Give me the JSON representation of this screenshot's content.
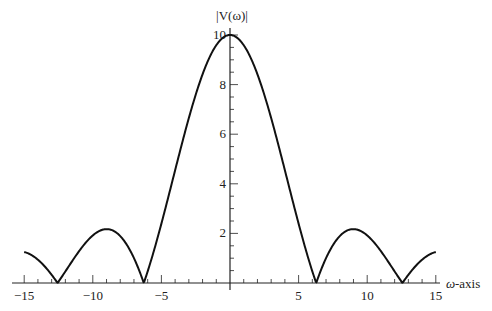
{
  "chart_data": {
    "type": "line",
    "title": "",
    "xlabel": "ω-axis",
    "ylabel": "|V(ω)|",
    "xlim": [
      -15,
      15
    ],
    "ylim": [
      0,
      10
    ],
    "x_ticks": [
      -15,
      -10,
      -5,
      5,
      10,
      15
    ],
    "x_tick_labels": [
      "−15",
      "−10",
      "−5",
      "5",
      "10",
      "15"
    ],
    "y_ticks": [
      2,
      4,
      6,
      8,
      10
    ],
    "y_tick_labels": [
      "2",
      "4",
      "6",
      "8",
      "10"
    ],
    "grid": false,
    "legend": null,
    "function": "|V(ω)| = |20 sin(ω/2) / ω|",
    "series": [
      {
        "name": "|V(ω)|",
        "x": [
          -15,
          -14,
          -13,
          -12.57,
          -12,
          -11,
          -10,
          -9,
          -8,
          -7,
          -6.28,
          -6,
          -5,
          -4,
          -3,
          -2,
          -1,
          0,
          1,
          2,
          3,
          4,
          5,
          6,
          6.28,
          7,
          8,
          9,
          10,
          11,
          12,
          12.57,
          13,
          14,
          15
        ],
        "values": [
          1.25,
          0.94,
          0.33,
          0.0,
          0.47,
          1.28,
          1.92,
          2.17,
          1.89,
          1.0,
          0.0,
          0.47,
          2.39,
          4.55,
          6.65,
          8.41,
          9.59,
          10.0,
          9.59,
          8.41,
          6.65,
          4.55,
          2.39,
          0.47,
          0.0,
          1.0,
          1.89,
          2.17,
          1.92,
          1.28,
          0.47,
          0.0,
          0.33,
          0.94,
          1.25
        ]
      }
    ],
    "annotations": []
  },
  "axes": {
    "x_axis_label": "ω",
    "x_axis_suffix": "-axis",
    "y_axis_label": "|V(ω)|"
  }
}
